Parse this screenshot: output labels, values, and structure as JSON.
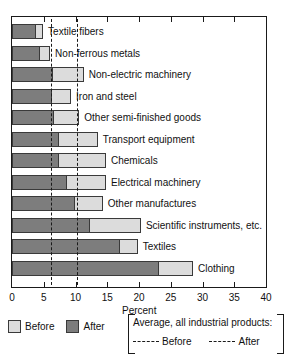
{
  "chart_data": {
    "type": "bar",
    "orientation": "horizontal",
    "stacked": false,
    "title": "",
    "xlabel": "Percent",
    "ylabel": "",
    "xlim": [
      0,
      40
    ],
    "xticks": [
      0,
      5,
      10,
      15,
      20,
      25,
      30,
      35,
      40
    ],
    "grid": false,
    "legend_position": "bottom",
    "categories": [
      "Textile fibers",
      "Non-ferrous metals",
      "Non-electric machinery",
      "Iron and steel",
      "Other semi-finished goods",
      "Transport equipment",
      "Chemicals",
      "Electrical machinery",
      "Other manufactures",
      "Scientific instruments, etc.",
      "Textiles",
      "Clothing"
    ],
    "series": [
      {
        "name": "Before",
        "color": "#dcdcdc",
        "values": [
          4.9,
          6.0,
          11.3,
          9.3,
          10.6,
          13.5,
          14.8,
          14.8,
          14.3,
          20.3,
          19.8,
          28.5
        ]
      },
      {
        "name": "After",
        "color": "#7d7d7d",
        "values": [
          3.6,
          4.3,
          6.3,
          6.2,
          6.4,
          7.3,
          7.3,
          8.5,
          9.8,
          12.2,
          16.8,
          23.0
        ]
      }
    ],
    "reference_lines": [
      {
        "name": "Average, all industrial products: Before",
        "value": 6.2,
        "style": "long-dash"
      },
      {
        "name": "Average, all industrial products: After",
        "value": 10.3,
        "style": "short-dash"
      }
    ],
    "legend": {
      "swatches": [
        {
          "label": "Before",
          "color": "#dcdcdc"
        },
        {
          "label": "After",
          "color": "#7d7d7d"
        }
      ],
      "reference_box_title": "Average, all industrial products:",
      "reference_entries": [
        {
          "label": "Before",
          "style": "long-dash"
        },
        {
          "label": "After",
          "style": "short-dash"
        }
      ]
    }
  },
  "colors": {
    "before": "#dcdcdc",
    "after": "#7d7d7d",
    "axis": "#1a1a1a",
    "background": "#ffffff"
  }
}
